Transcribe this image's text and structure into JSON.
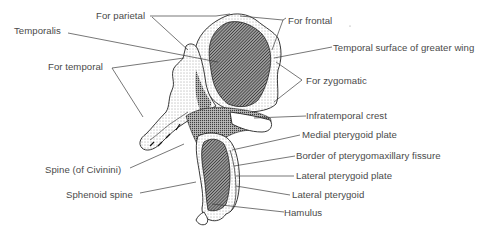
{
  "figure": {
    "labels": {
      "for_parietal": "For parietal",
      "for_frontal": "For frontal",
      "temporalis": "Temporalis",
      "temporal_surface": "Temporal surface of greater wing",
      "for_temporal": "For temporal",
      "for_zygomatic": "For zygomatic",
      "infratemporal_crest": "Infratemporal crest",
      "medial_pterygoid_plate": "Medial pterygoid plate",
      "border_pterygomaxillary": "Border of pterygomaxillary fissure",
      "spine_civinini": "Spine (of Civinini)",
      "lateral_pterygoid_plate": "Lateral pterygoid plate",
      "sphenoid_spine": "Sphenoid spine",
      "lateral_pterygoid": "Lateral pterygoid",
      "hamulus": "Hamulus"
    },
    "colors": {
      "text": "#4a4a4a",
      "lines": "#3c3c3c",
      "hatched_area": "#555555",
      "bone": "#ffffff"
    }
  }
}
